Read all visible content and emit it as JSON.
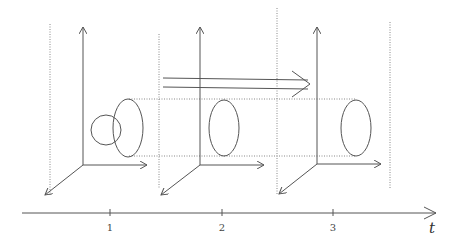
{
  "diagram": {
    "time_axis": {
      "label": "t",
      "ticks": [
        {
          "label": "1",
          "x": 110
        },
        {
          "label": "2",
          "x": 222
        },
        {
          "label": "3",
          "x": 333
        }
      ]
    },
    "frames": [
      {
        "index": 1,
        "shape": "ellipse linked with circle"
      },
      {
        "index": 2,
        "shape": "ellipse"
      },
      {
        "index": 3,
        "shape": "ellipse"
      }
    ],
    "progress_arrow": "double-line arrow pointing right",
    "colors": {
      "line": "#555555",
      "dotted": "#888888",
      "background": "#ffffff"
    }
  }
}
